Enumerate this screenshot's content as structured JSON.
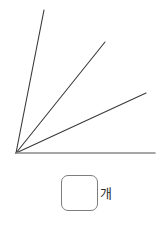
{
  "figure": {
    "canvas": {
      "width": 166,
      "height": 166
    },
    "vertex": {
      "x": 16,
      "y": 153
    },
    "baseline": {
      "name": "baseline-ray",
      "x1": 16,
      "y1": 153,
      "x2": 155,
      "y2": 153,
      "color": "#8a8a8a",
      "width": 1.6
    },
    "rays": [
      {
        "name": "ray-1",
        "x1": 16,
        "y1": 153,
        "x2": 44,
        "y2": 10,
        "color": "#3a3a3a",
        "width": 1.1
      },
      {
        "name": "ray-2",
        "x1": 16,
        "y1": 153,
        "x2": 105,
        "y2": 42,
        "color": "#3a3a3a",
        "width": 1.1
      },
      {
        "name": "ray-3",
        "x1": 16,
        "y1": 153,
        "x2": 146,
        "y2": 93,
        "color": "#3a3a3a",
        "width": 1.1
      }
    ]
  },
  "answer": {
    "value": "",
    "placeholder": "",
    "unit_label": "개",
    "box": {
      "x": 61,
      "y": 175,
      "width": 37,
      "height": 36,
      "radius": 7
    },
    "border_color": "#7d7d7d"
  },
  "colors": {
    "background": "#ffffff",
    "ray_line": "#3a3a3a",
    "baseline": "#8a8a8a",
    "box_border": "#7d7d7d",
    "text": "#2b2b2b"
  }
}
